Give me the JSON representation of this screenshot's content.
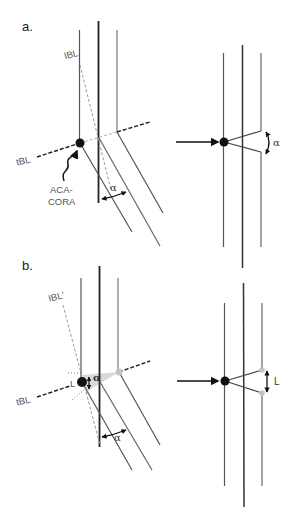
{
  "figure": {
    "panel_a": {
      "label": "a.",
      "labels": {
        "ibl": "IBL",
        "tbl": "tBL",
        "aca_line1": "ACA-",
        "aca_line2": "CORA",
        "angle": "α"
      },
      "right_angle_label": "α"
    },
    "panel_b": {
      "label": "b.",
      "labels": {
        "ibl_prime": "IBL′",
        "tbl": "tBL",
        "l_left": "L",
        "angle_small": "α",
        "angle": "α"
      },
      "right_length_label": "L"
    },
    "colors": {
      "line_dark": "#2a2a2a",
      "line_gray": "#6e6e6e",
      "dashed_gray": "#9a9a9a",
      "dot": "#111111",
      "gray_dot": "#c4c4c4",
      "shade": "#d9d9d9"
    }
  }
}
